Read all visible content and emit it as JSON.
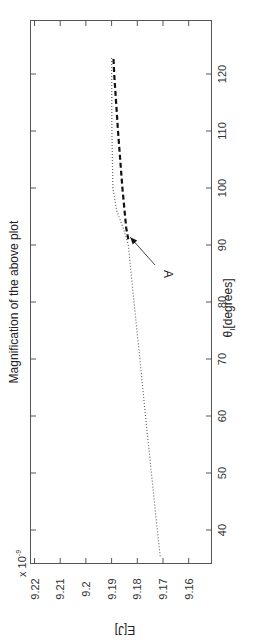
{
  "chart_data": {
    "type": "line",
    "title": "Magnification of the above plot",
    "xlabel": "θ_I [degrees]",
    "ylabel": "E[J]",
    "y_scale_label": "x 10^-9",
    "y_multiplier": 1e-09,
    "orientation": "rotated 90° clockwise (x-axis runs vertically, y-axis runs horizontally)",
    "xlim": [
      33,
      129
    ],
    "ylim": [
      9.155,
      9.222
    ],
    "x_ticks": [
      40,
      50,
      60,
      70,
      80,
      90,
      100,
      110,
      120
    ],
    "y_ticks": [
      9.16,
      9.17,
      9.18,
      9.19,
      9.2,
      9.21,
      9.22
    ],
    "grid": false,
    "legend": null,
    "series": [
      {
        "name": "dotted",
        "style": "dotted",
        "x": [
          35.4,
          40,
          50,
          60,
          70,
          80,
          90,
          93,
          96,
          100,
          110,
          123
        ],
        "values": [
          9.1711,
          9.1722,
          9.1745,
          9.1768,
          9.179,
          9.1813,
          9.1835,
          9.1855,
          9.188,
          9.1895,
          9.1899,
          9.19
        ]
      },
      {
        "name": "dashed",
        "style": "dashed-bold",
        "x": [
          91,
          93,
          100,
          110,
          120,
          123
        ],
        "values": [
          9.1835,
          9.1843,
          9.1858,
          9.1875,
          9.189,
          9.1893
        ]
      }
    ],
    "annotations": [
      {
        "text": "A",
        "points_to": {
          "x": 91,
          "y": 9.1835
        },
        "arrow": true
      }
    ]
  },
  "labels": {
    "title": "Magnification of the above plot",
    "xlabel_main": "θ",
    "xlabel_sub": "I",
    "xlabel_units": "[degrees]",
    "ylabel": "E[J]",
    "multiplier_base": "x 10",
    "multiplier_exp": "-9",
    "annotation": "A",
    "x_ticks": [
      "40",
      "50",
      "60",
      "70",
      "80",
      "90",
      "100",
      "110",
      "120"
    ],
    "y_ticks": [
      "9.22",
      "9.21",
      "9.2",
      "9.19",
      "9.18",
      "9.17",
      "9.16"
    ]
  }
}
